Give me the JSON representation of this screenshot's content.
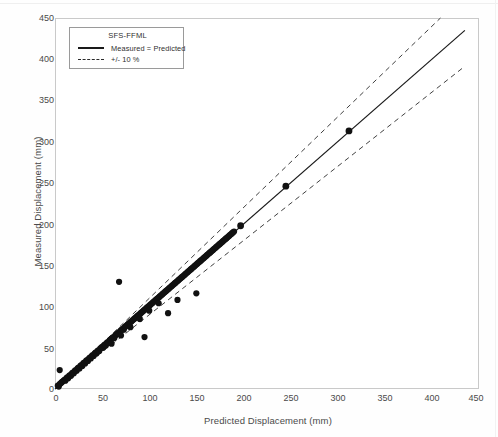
{
  "chart_data": {
    "type": "scatter",
    "title": "",
    "xlabel": "Predicted Displacement (mm)",
    "ylabel": "Measured Displacement (mm)",
    "xlim": [
      0,
      450
    ],
    "ylim": [
      0,
      450
    ],
    "xticks": [
      0,
      50,
      100,
      150,
      200,
      250,
      300,
      350,
      400,
      450
    ],
    "yticks": [
      0,
      50,
      100,
      150,
      200,
      250,
      300,
      350,
      400,
      450
    ],
    "grid": false,
    "legend_position": "top-left",
    "legend_title": "SFS-FFML",
    "legend": [
      {
        "label": "Measured = Predicted",
        "style": "solid",
        "color": "#1a1a1a"
      },
      {
        "label": "+/- 10 %",
        "style": "dashed",
        "color": "#2a2a2a"
      }
    ],
    "reference_line": {
      "name": "Measured = Predicted",
      "slope": 1,
      "intercept": 0,
      "x_range": [
        0,
        435
      ]
    },
    "tolerance_bands": {
      "name": "+/- 10 %",
      "upper_slope": 1.1,
      "lower_slope": 0.9
    },
    "series": [
      {
        "name": "SFS-FFML data points",
        "marker": "filled-circle",
        "color": "#111111",
        "points": [
          [
            3,
            4
          ],
          [
            4,
            3
          ],
          [
            5,
            6
          ],
          [
            5,
            23
          ],
          [
            6,
            7
          ],
          [
            7,
            8
          ],
          [
            8,
            9
          ],
          [
            9,
            10
          ],
          [
            10,
            11
          ],
          [
            11,
            10
          ],
          [
            12,
            13
          ],
          [
            13,
            14
          ],
          [
            14,
            13
          ],
          [
            15,
            16
          ],
          [
            16,
            17
          ],
          [
            17,
            16
          ],
          [
            18,
            19
          ],
          [
            19,
            20
          ],
          [
            20,
            19
          ],
          [
            21,
            22
          ],
          [
            22,
            23
          ],
          [
            23,
            22
          ],
          [
            24,
            25
          ],
          [
            25,
            26
          ],
          [
            26,
            25
          ],
          [
            27,
            28
          ],
          [
            28,
            29
          ],
          [
            29,
            28
          ],
          [
            30,
            31
          ],
          [
            31,
            32
          ],
          [
            32,
            31
          ],
          [
            33,
            34
          ],
          [
            34,
            35
          ],
          [
            35,
            34
          ],
          [
            36,
            37
          ],
          [
            37,
            38
          ],
          [
            38,
            37
          ],
          [
            39,
            40
          ],
          [
            40,
            41
          ],
          [
            41,
            40
          ],
          [
            42,
            43
          ],
          [
            43,
            44
          ],
          [
            44,
            43
          ],
          [
            45,
            46
          ],
          [
            46,
            47
          ],
          [
            47,
            46
          ],
          [
            48,
            49
          ],
          [
            49,
            50
          ],
          [
            50,
            51
          ],
          [
            51,
            50
          ],
          [
            52,
            53
          ],
          [
            53,
            54
          ],
          [
            54,
            53
          ],
          [
            55,
            56
          ],
          [
            56,
            57
          ],
          [
            57,
            56
          ],
          [
            58,
            59
          ],
          [
            59,
            60
          ],
          [
            60,
            61
          ],
          [
            60,
            55
          ],
          [
            61,
            62
          ],
          [
            62,
            63
          ],
          [
            63,
            62
          ],
          [
            64,
            65
          ],
          [
            65,
            66
          ],
          [
            66,
            67
          ],
          [
            67,
            68
          ],
          [
            68,
            130
          ],
          [
            68,
            67
          ],
          [
            69,
            70
          ],
          [
            70,
            71
          ],
          [
            70,
            65
          ],
          [
            71,
            72
          ],
          [
            72,
            73
          ],
          [
            73,
            72
          ],
          [
            74,
            75
          ],
          [
            75,
            76
          ],
          [
            76,
            77
          ],
          [
            77,
            78
          ],
          [
            78,
            79
          ],
          [
            79,
            80
          ],
          [
            80,
            81
          ],
          [
            80,
            75
          ],
          [
            81,
            82
          ],
          [
            82,
            83
          ],
          [
            83,
            84
          ],
          [
            84,
            85
          ],
          [
            85,
            86
          ],
          [
            86,
            87
          ],
          [
            87,
            88
          ],
          [
            88,
            89
          ],
          [
            89,
            90
          ],
          [
            90,
            91
          ],
          [
            90,
            85
          ],
          [
            91,
            92
          ],
          [
            92,
            93
          ],
          [
            93,
            94
          ],
          [
            94,
            95
          ],
          [
            95,
            96
          ],
          [
            95,
            63
          ],
          [
            96,
            97
          ],
          [
            97,
            98
          ],
          [
            98,
            99
          ],
          [
            99,
            100
          ],
          [
            100,
            101
          ],
          [
            100,
            95
          ],
          [
            101,
            102
          ],
          [
            102,
            103
          ],
          [
            103,
            104
          ],
          [
            104,
            105
          ],
          [
            105,
            106
          ],
          [
            106,
            107
          ],
          [
            107,
            108
          ],
          [
            108,
            109
          ],
          [
            109,
            110
          ],
          [
            110,
            111
          ],
          [
            110,
            104
          ],
          [
            111,
            112
          ],
          [
            112,
            113
          ],
          [
            113,
            114
          ],
          [
            114,
            115
          ],
          [
            115,
            116
          ],
          [
            116,
            117
          ],
          [
            117,
            118
          ],
          [
            118,
            119
          ],
          [
            119,
            120
          ],
          [
            120,
            121
          ],
          [
            120,
            92
          ],
          [
            121,
            122
          ],
          [
            122,
            123
          ],
          [
            123,
            124
          ],
          [
            124,
            125
          ],
          [
            125,
            126
          ],
          [
            126,
            127
          ],
          [
            127,
            128
          ],
          [
            128,
            129
          ],
          [
            129,
            130
          ],
          [
            130,
            131
          ],
          [
            130,
            108
          ],
          [
            131,
            132
          ],
          [
            132,
            133
          ],
          [
            133,
            134
          ],
          [
            134,
            135
          ],
          [
            135,
            136
          ],
          [
            136,
            137
          ],
          [
            137,
            138
          ],
          [
            138,
            139
          ],
          [
            139,
            140
          ],
          [
            140,
            141
          ],
          [
            141,
            142
          ],
          [
            142,
            143
          ],
          [
            143,
            144
          ],
          [
            144,
            145
          ],
          [
            145,
            146
          ],
          [
            146,
            147
          ],
          [
            147,
            148
          ],
          [
            148,
            149
          ],
          [
            149,
            150
          ],
          [
            150,
            151
          ],
          [
            150,
            116
          ],
          [
            151,
            152
          ],
          [
            152,
            153
          ],
          [
            153,
            154
          ],
          [
            154,
            155
          ],
          [
            155,
            156
          ],
          [
            156,
            157
          ],
          [
            157,
            158
          ],
          [
            158,
            159
          ],
          [
            159,
            160
          ],
          [
            160,
            161
          ],
          [
            161,
            162
          ],
          [
            162,
            163
          ],
          [
            163,
            164
          ],
          [
            164,
            165
          ],
          [
            165,
            166
          ],
          [
            166,
            167
          ],
          [
            167,
            168
          ],
          [
            168,
            169
          ],
          [
            169,
            170
          ],
          [
            170,
            171
          ],
          [
            171,
            172
          ],
          [
            172,
            173
          ],
          [
            173,
            174
          ],
          [
            174,
            175
          ],
          [
            175,
            176
          ],
          [
            176,
            177
          ],
          [
            177,
            178
          ],
          [
            178,
            179
          ],
          [
            179,
            180
          ],
          [
            180,
            181
          ],
          [
            181,
            182
          ],
          [
            182,
            183
          ],
          [
            183,
            184
          ],
          [
            184,
            185
          ],
          [
            185,
            186
          ],
          [
            186,
            187
          ],
          [
            187,
            188
          ],
          [
            188,
            189
          ],
          [
            189,
            190
          ],
          [
            190,
            191
          ],
          [
            197,
            198
          ],
          [
            245,
            246
          ],
          [
            312,
            313
          ]
        ]
      }
    ]
  },
  "axes": {
    "x_title": "Predicted Displacement (mm)",
    "y_title": "Measured Displacement (mm)",
    "x_tick_labels": [
      "0",
      "50",
      "100",
      "150",
      "200",
      "250",
      "300",
      "350",
      "400",
      "450"
    ],
    "y_tick_labels": [
      "0",
      "50",
      "100",
      "150",
      "200",
      "250",
      "300",
      "350",
      "400",
      "450"
    ]
  },
  "legend": {
    "title": "SFS-FFML",
    "items": [
      {
        "label": "Measured = Predicted"
      },
      {
        "label": "+/- 10 %"
      }
    ]
  },
  "colors": {
    "marker": "#111111",
    "line": "#1a1a1a",
    "frame": "#c9c9c9",
    "text": "#4a4a4a",
    "background": "#ffffff"
  }
}
